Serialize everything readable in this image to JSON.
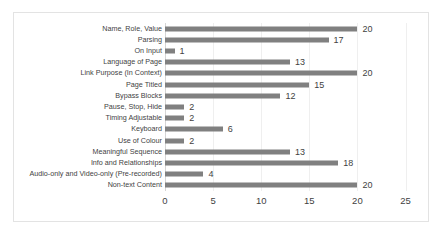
{
  "chart_data": {
    "type": "bar",
    "orientation": "horizontal",
    "title": "",
    "xlabel": "",
    "ylabel": "",
    "xlim": [
      0,
      25
    ],
    "xticks": [
      "0",
      "5",
      "10",
      "15",
      "20",
      "25"
    ],
    "grid": true,
    "legend": "none",
    "bar_color": "#808080",
    "categories": [
      "Name, Role, Value",
      "Parsing",
      "On Input",
      "Language of Page",
      "Link Purpose (In Context)",
      "Page Titled",
      "Bypass Blocks",
      "Pause, Stop, Hide",
      "Timing Adjustable",
      "Keyboard",
      "Use of Colour",
      "Meaningful Sequence",
      "Info and Relationships",
      "Audio-only and Video-only (Pre-recorded)",
      "Non-text Content"
    ],
    "values": [
      20,
      17,
      1,
      13,
      20,
      15,
      12,
      2,
      2,
      6,
      2,
      13,
      18,
      4,
      20
    ],
    "data_labels": [
      "20",
      "17",
      "1",
      "13",
      "20",
      "15",
      "12",
      "2",
      "2",
      "6",
      "2",
      "13",
      "18",
      "4",
      "20"
    ]
  }
}
